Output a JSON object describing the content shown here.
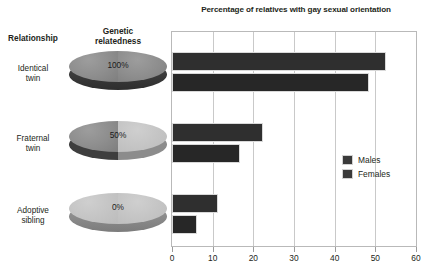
{
  "chart_data": {
    "type": "bar",
    "orientation": "horizontal",
    "title": "Percentage of relatives with gay sexual orientation",
    "xlabel": "",
    "ylabel": "",
    "xlim": [
      0,
      60
    ],
    "xticks": [
      0,
      10,
      20,
      30,
      40,
      50,
      60
    ],
    "xtick_labels": [
      "0",
      "10",
      "20",
      "30",
      "40",
      "50",
      "60"
    ],
    "grid": true,
    "legend_position": "right-middle",
    "categories": [
      "Identical twin",
      "Fraternal twin",
      "Adoptive sibling"
    ],
    "series": [
      {
        "name": "Males",
        "values": [
          52.7,
          22.3,
          11.2
        ],
        "color": "#2f2f2f"
      },
      {
        "name": "Females",
        "values": [
          48.4,
          16.6,
          6.2
        ],
        "color": "#272727"
      }
    ]
  },
  "header": {
    "relationship": "Relationship",
    "relatedness_line1": "Genetic",
    "relatedness_line2": "relatedness"
  },
  "rows": [
    {
      "label_line1": "Identical",
      "label_line2": "twin",
      "relatedness_pct": "100%",
      "disc_fill": "full",
      "males": 52.7,
      "females": 48.4
    },
    {
      "label_line1": "Fraternal",
      "label_line2": "twin",
      "relatedness_pct": "50%",
      "disc_fill": "half",
      "males": 22.3,
      "females": 16.6
    },
    {
      "label_line1": "Adoptive",
      "label_line2": "sibling",
      "relatedness_pct": "0%",
      "disc_fill": "none",
      "males": 11.2,
      "females": 6.2
    }
  ],
  "legend": {
    "items": [
      {
        "label": "Males",
        "color": "#3a3a3a"
      },
      {
        "label": "Females",
        "color": "#3a3a3a"
      }
    ]
  },
  "axis": {
    "tick_labels": [
      "0",
      "10",
      "20",
      "30",
      "40",
      "50",
      "60"
    ]
  },
  "colors": {
    "bar_males": "#2f2f2f",
    "bar_females": "#272727",
    "disc_dark": "#8d8d8d",
    "disc_light": "#c4c4c4",
    "grid": "#c9c9c9",
    "text": "#231f20"
  }
}
